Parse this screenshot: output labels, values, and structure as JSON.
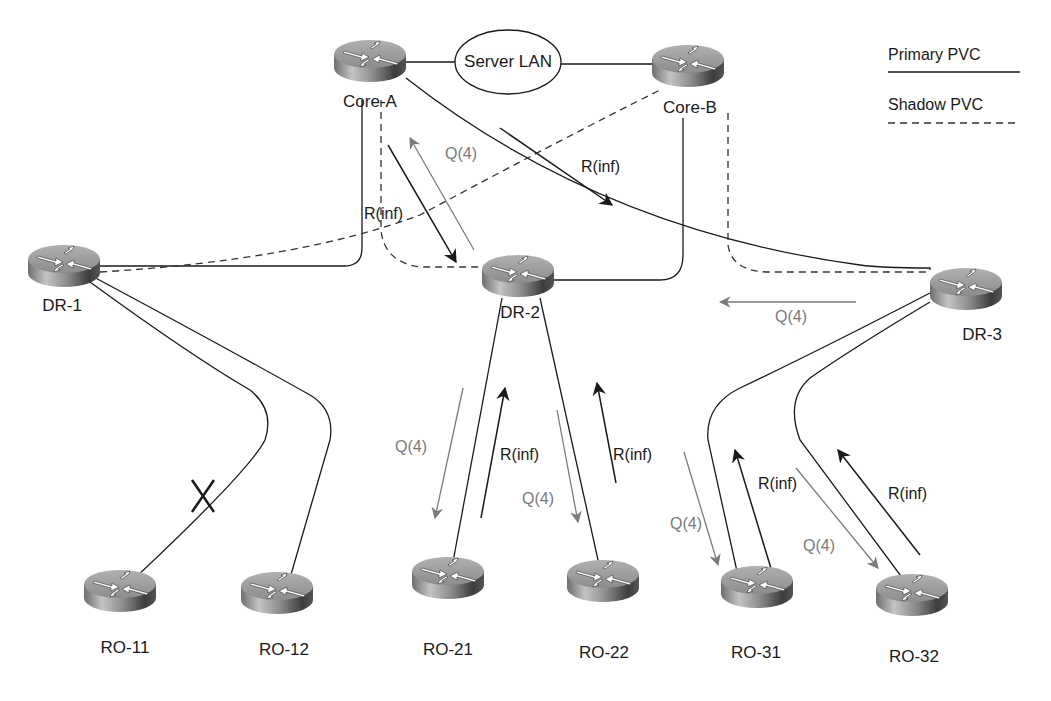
{
  "diagram": {
    "legend": {
      "primary_label": "Primary PVC",
      "shadow_label": "Shadow PVC"
    },
    "server_lan": {
      "label": "Server LAN"
    },
    "routers": [
      {
        "id": "core-a",
        "label": "Core-A",
        "x": 370,
        "y": 60
      },
      {
        "id": "core-b",
        "label": "Core-B",
        "x": 688,
        "y": 65
      },
      {
        "id": "dr-1",
        "label": "DR-1",
        "x": 64,
        "y": 265
      },
      {
        "id": "dr-2",
        "label": "DR-2",
        "x": 518,
        "y": 275
      },
      {
        "id": "dr-3",
        "label": "DR-3",
        "x": 966,
        "y": 288
      },
      {
        "id": "ro-11",
        "label": "RO-11",
        "x": 120,
        "y": 610
      },
      {
        "id": "ro-12",
        "label": "RO-12",
        "x": 277,
        "y": 612
      },
      {
        "id": "ro-21",
        "label": "RO-21",
        "x": 448,
        "y": 597
      },
      {
        "id": "ro-22",
        "label": "RO-22",
        "x": 603,
        "y": 600
      },
      {
        "id": "ro-31",
        "label": "RO-31",
        "x": 757,
        "y": 606
      },
      {
        "id": "ro-32",
        "label": "RO-32",
        "x": 912,
        "y": 614
      }
    ],
    "annotations": [
      {
        "id": "q-core-a",
        "text": "Q(4)",
        "type": "query",
        "x": 445,
        "y": 145
      },
      {
        "id": "r-core-a",
        "text": "R(inf)",
        "type": "reply",
        "x": 364,
        "y": 205
      },
      {
        "id": "r-core-a-dr3",
        "text": "R(inf)",
        "type": "reply",
        "x": 581,
        "y": 158
      },
      {
        "id": "q-dr3",
        "text": "Q(4)",
        "type": "query",
        "x": 775,
        "y": 308
      },
      {
        "id": "q-ro21",
        "text": "Q(4)",
        "type": "query",
        "x": 395,
        "y": 438
      },
      {
        "id": "r-ro21",
        "text": "R(inf)",
        "type": "reply",
        "x": 500,
        "y": 446
      },
      {
        "id": "q-ro22",
        "text": "Q(4)",
        "type": "query",
        "x": 522,
        "y": 490
      },
      {
        "id": "r-ro22",
        "text": "R(inf)",
        "type": "reply",
        "x": 613,
        "y": 446
      },
      {
        "id": "q-ro31",
        "text": "Q(4)",
        "type": "query",
        "x": 670,
        "y": 515
      },
      {
        "id": "r-ro31",
        "text": "R(inf)",
        "type": "reply",
        "x": 758,
        "y": 475
      },
      {
        "id": "q-ro32",
        "text": "Q(4)",
        "type": "query",
        "x": 803,
        "y": 537
      },
      {
        "id": "r-ro32",
        "text": "R(inf)",
        "type": "reply",
        "x": 888,
        "y": 485
      }
    ],
    "failed_link": {
      "between": [
        "DR-1",
        "RO-11"
      ],
      "marker": "X"
    },
    "colors": {
      "primary_line": "#1a1a1a",
      "shadow_line": "#333333",
      "query_arrow": "#7a7a7a",
      "reply_arrow": "#1a1a1a",
      "router_top": "#9a9a9a",
      "router_side_dark": "#3a3a3a",
      "router_side_light": "#b8b8b8"
    }
  }
}
